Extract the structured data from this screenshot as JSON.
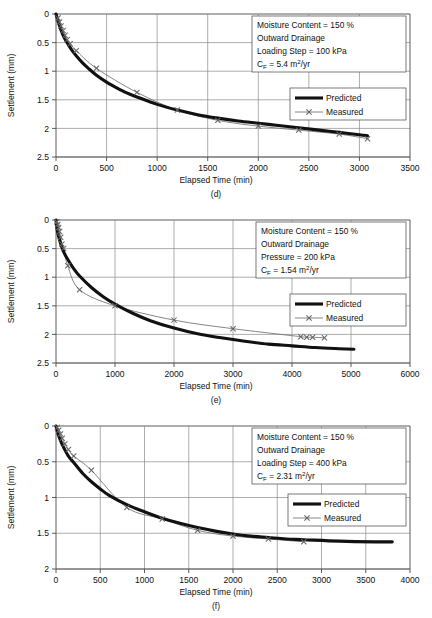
{
  "figure": {
    "panels": [
      {
        "id": "d",
        "caption": "(d)",
        "xlabel": "Elapsed Time (min)",
        "ylabel": "Settlement (mm)",
        "annotation": {
          "line1": "Moisture Content = 150 %",
          "line2": "Outward  Drainage",
          "line3": "Loading Step = 100 kPa",
          "line4_pre": "C",
          "line4_sub": "F",
          "line4_post": " = 5.4 m",
          "line4_sup": "2",
          "line4_tail": "/yr"
        },
        "legend": {
          "predicted": "Predicted",
          "measured": "Measured"
        },
        "xticks": [
          "0",
          "500",
          "1000",
          "1500",
          "2000",
          "2500",
          "3000",
          "3500"
        ],
        "yticks": [
          "0",
          "0.5",
          "1",
          "1.5",
          "2",
          "2.5"
        ]
      },
      {
        "id": "e",
        "caption": "(e)",
        "xlabel": "Elapsed Time (min)",
        "ylabel": "Settlement (mm)",
        "annotation": {
          "line1": "Moisture Content = 150 %",
          "line2": "Outward  Drainage",
          "line3": "Pressure = 200 kPa",
          "line4_pre": "C",
          "line4_sub": "F",
          "line4_post": " = 1.54 m",
          "line4_sup": "2",
          "line4_tail": "/yr"
        },
        "legend": {
          "predicted": "Predicted",
          "measured": "Measured"
        },
        "xticks": [
          "0",
          "1000",
          "2000",
          "3000",
          "4000",
          "5000",
          "6000"
        ],
        "yticks": [
          "0",
          "0.5",
          "1",
          "1.5",
          "2",
          "2.5"
        ]
      },
      {
        "id": "f",
        "caption": "(f)",
        "xlabel": "Elapsed Time (min)",
        "ylabel": "Settlement (mm)",
        "annotation": {
          "line1": "Moisture Content = 150 %",
          "line2": "Outward  Drainage",
          "line3": "Loading Step = 400 kPa",
          "line4_pre": "C",
          "line4_sub": "F",
          "line4_post": " = 2.31 m",
          "line4_sup": "2",
          "line4_tail": "/yr"
        },
        "legend": {
          "predicted": "Predicted",
          "measured": "Measured"
        },
        "xticks": [
          "0",
          "500",
          "1000",
          "1500",
          "2000",
          "2500",
          "3000",
          "3500",
          "4000"
        ],
        "yticks": [
          "0",
          "0.5",
          "1",
          "1.5",
          "2"
        ]
      }
    ]
  },
  "chart_data": [
    {
      "type": "line",
      "id": "d",
      "title": "",
      "xlabel": "Elapsed Time (min)",
      "ylabel": "Settlement (mm)",
      "xlim": [
        0,
        3500
      ],
      "ylim": [
        0,
        2.5
      ],
      "y_inverted": true,
      "xticks": [
        0,
        500,
        1000,
        1500,
        2000,
        2500,
        3000,
        3500
      ],
      "yticks": [
        0,
        0.5,
        1,
        1.5,
        2,
        2.5
      ],
      "grid": true,
      "legend_position": "right",
      "annotations": [
        "Moisture Content = 150 %",
        "Outward  Drainage",
        "Loading Step = 100 kPa",
        "CF = 5.4 m2/yr"
      ],
      "series": [
        {
          "name": "Predicted",
          "style": "thick-black-line",
          "x": [
            0,
            30,
            60,
            90,
            120,
            160,
            200,
            260,
            320,
            400,
            500,
            600,
            700,
            800,
            1000,
            1200,
            1400,
            1600,
            1800,
            2000,
            2200,
            2400,
            2600,
            2800,
            3000,
            3080
          ],
          "y": [
            0.0,
            0.18,
            0.33,
            0.44,
            0.53,
            0.64,
            0.73,
            0.85,
            0.95,
            1.07,
            1.19,
            1.29,
            1.38,
            1.45,
            1.58,
            1.68,
            1.76,
            1.82,
            1.87,
            1.91,
            1.95,
            1.99,
            2.03,
            2.07,
            2.11,
            2.13
          ]
        },
        {
          "name": "Measured",
          "style": "thin-grey-line-x-markers",
          "x": [
            20,
            35,
            50,
            70,
            90,
            110,
            140,
            200,
            400,
            800,
            1200,
            1600,
            2000,
            2400,
            2800,
            3080
          ],
          "y": [
            0.07,
            0.14,
            0.21,
            0.29,
            0.37,
            0.45,
            0.52,
            0.64,
            0.95,
            1.37,
            1.68,
            1.86,
            1.96,
            2.03,
            2.1,
            2.18
          ]
        }
      ]
    },
    {
      "type": "line",
      "id": "e",
      "title": "",
      "xlabel": "Elapsed Time (min)",
      "ylabel": "Settlement (mm)",
      "xlim": [
        0,
        6000
      ],
      "ylim": [
        0,
        2.5
      ],
      "y_inverted": true,
      "xticks": [
        0,
        1000,
        2000,
        3000,
        4000,
        5000,
        6000
      ],
      "yticks": [
        0,
        0.5,
        1,
        1.5,
        2,
        2.5
      ],
      "grid": true,
      "legend_position": "right",
      "annotations": [
        "Moisture Content = 150 %",
        "Outward  Drainage",
        "Pressure = 200 kPa",
        "CF = 1.54 m2/yr"
      ],
      "series": [
        {
          "name": "Predicted",
          "style": "thick-black-line",
          "x": [
            0,
            20,
            50,
            90,
            140,
            200,
            300,
            400,
            600,
            800,
            1000,
            1300,
            1600,
            2000,
            2400,
            2800,
            3200,
            3600,
            4000,
            4400,
            4800,
            5050
          ],
          "y": [
            0.0,
            0.17,
            0.31,
            0.45,
            0.58,
            0.69,
            0.85,
            0.98,
            1.18,
            1.34,
            1.47,
            1.63,
            1.76,
            1.89,
            1.99,
            2.06,
            2.12,
            2.17,
            2.2,
            2.23,
            2.25,
            2.26
          ]
        },
        {
          "name": "Measured",
          "style": "thin-grey-line-x-markers",
          "x": [
            15,
            30,
            45,
            60,
            80,
            100,
            130,
            200,
            400,
            1000,
            2000,
            3000,
            4150,
            4250,
            4350,
            4550
          ],
          "y": [
            0.03,
            0.08,
            0.13,
            0.2,
            0.3,
            0.42,
            0.5,
            0.8,
            1.22,
            1.5,
            1.75,
            1.9,
            2.04,
            2.05,
            2.05,
            2.06
          ]
        }
      ]
    },
    {
      "type": "line",
      "id": "f",
      "title": "",
      "xlabel": "Elapsed Time (min)",
      "ylabel": "Settlement (mm)",
      "xlim": [
        0,
        4000
      ],
      "ylim": [
        0,
        2.0
      ],
      "y_inverted": true,
      "xticks": [
        0,
        500,
        1000,
        1500,
        2000,
        2500,
        3000,
        3500,
        4000
      ],
      "yticks": [
        0,
        0.5,
        1,
        1.5,
        2
      ],
      "grid": true,
      "legend_position": "right",
      "annotations": [
        "Moisture Content = 150 %",
        "Outward  Drainage",
        "Loading Step = 400 kPa",
        "CF = 2.31 m2/yr"
      ],
      "series": [
        {
          "name": "Predicted",
          "style": "thick-black-line",
          "x": [
            0,
            20,
            50,
            90,
            140,
            200,
            300,
            400,
            500,
            600,
            800,
            1000,
            1200,
            1400,
            1600,
            1800,
            2000,
            2200,
            2400,
            2600,
            2800,
            3200,
            3600,
            3800
          ],
          "y": [
            0.0,
            0.1,
            0.2,
            0.31,
            0.42,
            0.51,
            0.66,
            0.78,
            0.88,
            0.97,
            1.1,
            1.2,
            1.29,
            1.36,
            1.42,
            1.47,
            1.51,
            1.54,
            1.56,
            1.58,
            1.59,
            1.61,
            1.62,
            1.62
          ]
        },
        {
          "name": "Measured",
          "style": "thin-grey-line-x-markers",
          "x": [
            15,
            30,
            50,
            70,
            100,
            140,
            200,
            400,
            800,
            1200,
            1600,
            2000,
            2400,
            2800
          ],
          "y": [
            0.02,
            0.06,
            0.11,
            0.17,
            0.25,
            0.33,
            0.42,
            0.62,
            1.14,
            1.3,
            1.46,
            1.54,
            1.58,
            1.62
          ]
        }
      ]
    }
  ]
}
